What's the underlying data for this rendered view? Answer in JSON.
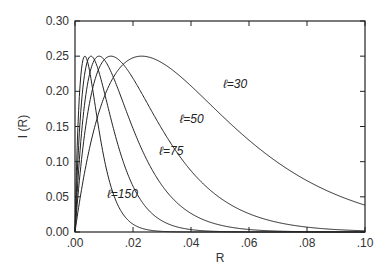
{
  "chart_data": {
    "type": "line",
    "title": "",
    "xlabel": "R",
    "ylabel": "I (R)",
    "xlim": [
      0.0,
      0.1
    ],
    "ylim": [
      0.0,
      0.3
    ],
    "xticks": [
      ".00",
      ".02",
      ".04",
      ".06",
      ".08",
      ".10"
    ],
    "yticks": [
      "0.00",
      "0.05",
      "0.10",
      "0.15",
      "0.20",
      "0.25",
      "0.30"
    ],
    "grid": false,
    "legend": "none (inline annotations)",
    "model": "I = 0.25 * (R/Rp) * exp(1 - R/Rp)",
    "series": [
      {
        "name": "ℓ=30",
        "peak_R": 0.023,
        "peak_I": 0.25,
        "I_at_0.10": 0.04
      },
      {
        "name": "ℓ=50",
        "peak_R": 0.0124,
        "peak_I": 0.25
      },
      {
        "name": "ℓ=75",
        "peak_R": 0.0083,
        "peak_I": 0.25
      },
      {
        "name": "unlabeled",
        "peak_R": 0.0055,
        "peak_I": 0.25
      },
      {
        "name": "ℓ=150",
        "peak_R": 0.0034,
        "peak_I": 0.25
      }
    ],
    "annotations": [
      {
        "text": "ℓ=30",
        "x": 0.051,
        "y": 0.205
      },
      {
        "text": "ℓ=50",
        "x": 0.036,
        "y": 0.155
      },
      {
        "text": "ℓ=75",
        "x": 0.029,
        "y": 0.11
      },
      {
        "text": "ℓ=150",
        "x": 0.011,
        "y": 0.048
      }
    ]
  }
}
